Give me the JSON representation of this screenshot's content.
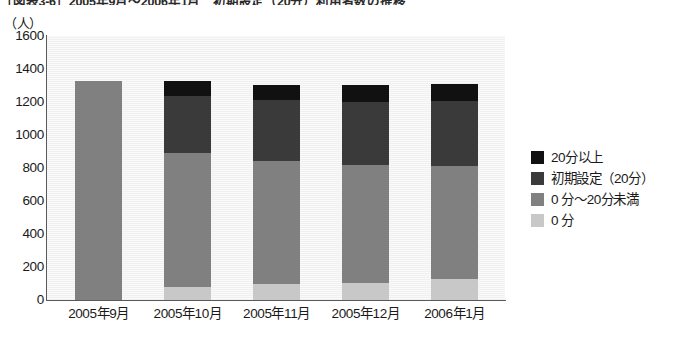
{
  "figure": {
    "title": "［図表3-6］2005年9月～2006年1月　初期設定（20分）利用者数の推移",
    "unit_label": "（人）"
  },
  "chart_data": {
    "type": "bar",
    "stacked": true,
    "title": "［図表3-6］2005年9月～2006年1月　初期設定（20分）利用者数の推移",
    "xlabel": "",
    "ylabel": "（人）",
    "ylim": [
      0,
      1600
    ],
    "ytick_step": 200,
    "yticks": [
      1600,
      1400,
      1200,
      1000,
      800,
      600,
      400,
      200,
      0
    ],
    "grid": false,
    "legend_position": "right",
    "categories": [
      "2005年9月",
      "2005年10月",
      "2005年11月",
      "2005年12月",
      "2006年1月"
    ],
    "series": [
      {
        "name": "0 分",
        "color": "#c8c8c8",
        "values": [
          0,
          80,
          100,
          105,
          125
        ]
      },
      {
        "name": "0 分～20分未満",
        "color": "#808080",
        "values": [
          1330,
          810,
          740,
          715,
          690
        ]
      },
      {
        "name": "初期設定（20分）",
        "color": "#3a3a3a",
        "values": [
          0,
          345,
          375,
          380,
          390
        ]
      },
      {
        "name": "20分以上",
        "color": "#111111",
        "values": [
          0,
          95,
          90,
          105,
          105
        ]
      }
    ],
    "totals": [
      1330,
      1330,
      1305,
      1305,
      1310
    ]
  },
  "legend": {
    "items": [
      {
        "label": "20分以上",
        "color": "#111111"
      },
      {
        "label": "初期設定（20分）",
        "color": "#3a3a3a"
      },
      {
        "label": "0 分～20分未満",
        "color": "#808080"
      },
      {
        "label": "0 分",
        "color": "#c8c8c8"
      }
    ]
  }
}
